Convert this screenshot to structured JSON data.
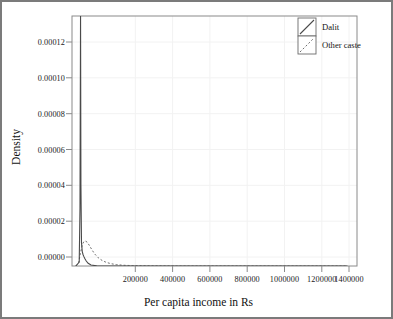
{
  "chart_data": {
    "type": "line",
    "title": "",
    "xlabel": "Per capita income in Rs",
    "ylabel": "Density",
    "xlim": [
      0,
      1500000
    ],
    "ylim": [
      0,
      0.00013
    ],
    "grid": true,
    "legend_position": "top-right",
    "xticks": [
      200000,
      400000,
      600000,
      800000,
      1000000,
      1200000,
      1400000
    ],
    "xtick_labels": [
      "200000",
      "400000",
      "600000",
      "800000",
      "1000000",
      "1200000",
      "1400000"
    ],
    "yticks": [
      0.0,
      2e-05,
      4e-05,
      6e-05,
      8e-05,
      0.0001,
      0.00012
    ],
    "ytick_labels": [
      "0.00000",
      "0.00002",
      "0.00004",
      "0.00006",
      "0.00008",
      "0.00010",
      "0.00012"
    ],
    "series": [
      {
        "name": "Dalit",
        "style": "solid",
        "color": "#4a4a4a",
        "x": [
          20000,
          38000,
          42000,
          45000,
          47000,
          50000,
          54000,
          58000,
          62000,
          68000,
          75000,
          85000,
          100000,
          130000,
          170000,
          220000,
          300000,
          450000,
          700000,
          1000000,
          1250000,
          1450000
        ],
        "y": [
          0.0,
          2e-06,
          3e-05,
          0.000132,
          4.2e-05,
          1.2e-05,
          7.5e-06,
          6e-06,
          5e-06,
          3.8e-06,
          2.6e-06,
          1.4e-06,
          5e-07,
          1e-07,
          0.0,
          0.0,
          0.0,
          0.0,
          0.0,
          0.0,
          0.0,
          0.0
        ]
      },
      {
        "name": "Other caste",
        "style": "dashed",
        "color": "#6f6f6f",
        "x": [
          20000,
          35000,
          45000,
          55000,
          62000,
          70000,
          80000,
          92000,
          105000,
          120000,
          138000,
          158000,
          180000,
          205000,
          235000,
          270000,
          320000,
          400000,
          550000,
          800000,
          1100000,
          1450000
        ],
        "y": [
          0.0,
          1.8e-06,
          7e-06,
          1.13e-05,
          1.26e-05,
          1.3e-05,
          1.24e-05,
          1.06e-05,
          8.4e-06,
          6.2e-06,
          4.3e-06,
          2.9e-06,
          1.9e-06,
          1.2e-06,
          7e-07,
          4e-07,
          2e-07,
          1e-07,
          0.0,
          0.0,
          0.0,
          0.0
        ]
      }
    ],
    "annotations": {
      "dalit_spike_clipped": "Dalit density spike extends above the top of the plotting region"
    }
  },
  "legend": {
    "entries": [
      {
        "label": "Dalit",
        "style": "solid"
      },
      {
        "label": "Other caste",
        "style": "dashed"
      }
    ]
  },
  "colors": {
    "frame": "#7b7b7b",
    "grid": "#f2f2f2",
    "axis": "#8a8a8a",
    "text": "#111111",
    "dalit": "#4a4a4a",
    "other_caste": "#6f6f6f",
    "background": "#ffffff"
  }
}
